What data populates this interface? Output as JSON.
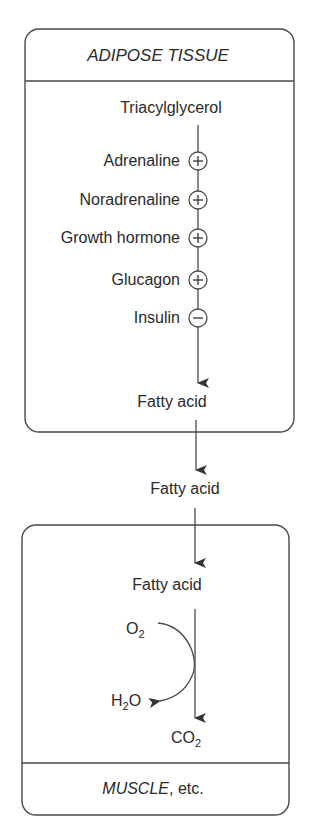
{
  "adipose_box": {
    "title": "ADIPOSE TISSUE",
    "substrate": "Triacylglycerol",
    "regulators": [
      {
        "label": "Adrenaline",
        "effect": "+",
        "icon": "plus-circle-icon"
      },
      {
        "label": "Noradrenaline",
        "effect": "+",
        "icon": "plus-circle-icon"
      },
      {
        "label": "Growth hormone",
        "effect": "+",
        "icon": "plus-circle-icon"
      },
      {
        "label": "Glucagon",
        "effect": "+",
        "icon": "plus-circle-icon"
      },
      {
        "label": "Insulin",
        "effect": "−",
        "icon": "minus-circle-icon"
      }
    ],
    "product": "Fatty acid"
  },
  "blood": {
    "label": "Fatty acid"
  },
  "muscle_box": {
    "substrate": "Fatty acid",
    "o2": {
      "base": "O",
      "sub": "2"
    },
    "h2o": {
      "pre": "H",
      "sub": "2",
      "post": "O"
    },
    "co2": {
      "base": "CO",
      "sub": "2"
    },
    "title_italic": "MUSCLE",
    "title_rest": ", etc."
  },
  "colors": {
    "stroke": "#4a4a4a",
    "text": "#2a2a2a"
  }
}
